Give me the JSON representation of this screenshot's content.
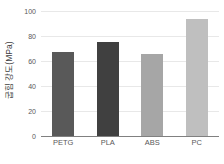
{
  "chart_data": {
    "type": "bar",
    "title": "",
    "subtitle": "",
    "xlabel": "",
    "ylabel": "굽힘 강도(MPa)",
    "categories": [
      "PETG",
      "PLA",
      "ABS",
      "PC"
    ],
    "values": [
      67,
      75,
      66,
      94
    ],
    "series": [
      {
        "name": "굽힘 강도(MPa)",
        "values": [
          67,
          75,
          66,
          94
        ]
      }
    ],
    "ylim": [
      0,
      100
    ],
    "yticks": [
      0,
      20,
      40,
      60,
      80,
      100
    ],
    "ytick_labels": [
      "0",
      "20",
      "40",
      "60",
      "80",
      "100"
    ],
    "xtick_labels": [
      "PETG",
      "PLA",
      "ABS",
      "PC"
    ],
    "grid": true,
    "grid_axis": "y",
    "legend": false,
    "legend_position": "none",
    "annotations": [],
    "bar_colors": [
      "#595959",
      "#404040",
      "#a6a6a6",
      "#bfbfbf"
    ],
    "gridline_color": "#e8e8e8",
    "axis_color": "#808080",
    "tick_label_color": "#595959",
    "axis_title_color": "#3f3f3f",
    "background_color": "#ffffff"
  }
}
